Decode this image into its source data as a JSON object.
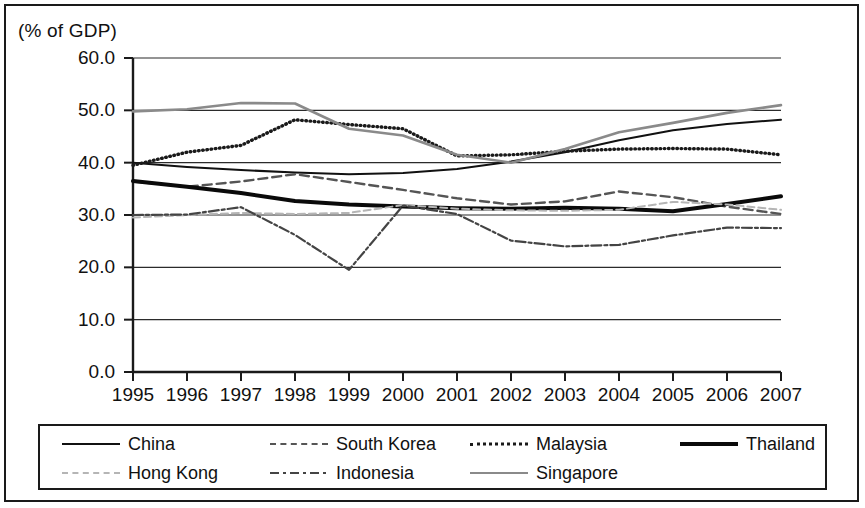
{
  "axis_title": "(% of GDP)",
  "legend": {
    "rows": [
      [
        {
          "label": "China",
          "style": "solid-thin",
          "color": "#111111"
        },
        {
          "label": "South Korea",
          "style": "dashed",
          "color": "#555555"
        },
        {
          "label": "Malaysia",
          "style": "dotted",
          "color": "#1a1a1a"
        },
        {
          "label": "Thailand",
          "style": "solid-thick",
          "color": "#0a0a0a"
        }
      ],
      [
        {
          "label": "Hong Kong",
          "style": "gray-thin",
          "color": "#b5b5b5"
        },
        {
          "label": "Indonesia",
          "style": "dashdot",
          "color": "#444444"
        },
        {
          "label": "Singapore",
          "style": "solid-gray",
          "color": "#8a8a8a"
        }
      ]
    ]
  },
  "chart_data": {
    "type": "line",
    "title": "",
    "xlabel": "",
    "ylabel": "(% of GDP)",
    "ylim": [
      0.0,
      60.0
    ],
    "yticks": [
      "0.0",
      "10.0",
      "20.0",
      "30.0",
      "40.0",
      "50.0",
      "60.0"
    ],
    "ytick_values": [
      0.0,
      10.0,
      20.0,
      30.0,
      40.0,
      50.0,
      60.0
    ],
    "grid": true,
    "legend_position": "bottom",
    "categories": [
      "1995",
      "1996",
      "1997",
      "1998",
      "1999",
      "2000",
      "2001",
      "2002",
      "2003",
      "2004",
      "2005",
      "2006",
      "2007"
    ],
    "series": [
      {
        "name": "China",
        "style": "solid-thin",
        "color": "#111111",
        "values": [
          40.0,
          39.2,
          38.6,
          38.1,
          37.8,
          38.0,
          38.8,
          40.2,
          42.0,
          44.3,
          46.2,
          47.4,
          48.2
        ]
      },
      {
        "name": "South Korea",
        "style": "dashed",
        "color": "#555555",
        "values": [
          36.4,
          35.4,
          36.4,
          37.8,
          36.3,
          34.8,
          33.2,
          32.0,
          32.6,
          34.5,
          33.4,
          31.6,
          30.2
        ]
      },
      {
        "name": "Malaysia",
        "style": "dotted",
        "color": "#1a1a1a",
        "values": [
          39.5,
          42.0,
          43.3,
          48.2,
          47.3,
          46.5,
          41.3,
          41.5,
          42.2,
          42.6,
          42.7,
          42.6,
          41.5
        ]
      },
      {
        "name": "Thailand",
        "style": "solid-thick",
        "color": "#0a0a0a",
        "values": [
          36.5,
          35.4,
          34.2,
          32.7,
          32.0,
          31.6,
          31.3,
          31.2,
          31.4,
          31.2,
          30.7,
          32.1,
          33.6
        ]
      },
      {
        "name": "Hong Kong",
        "style": "gray-thin",
        "color": "#b5b5b5",
        "values": [
          29.5,
          30.0,
          30.4,
          30.2,
          30.4,
          31.9,
          31.2,
          30.9,
          30.8,
          31.0,
          32.5,
          32.0,
          31.0
        ]
      },
      {
        "name": "Indonesia",
        "style": "dashdot",
        "color": "#444444",
        "values": [
          30.0,
          30.1,
          31.5,
          26.2,
          19.5,
          31.8,
          30.2,
          25.1,
          24.0,
          24.3,
          26.1,
          27.6,
          27.5
        ]
      },
      {
        "name": "Singapore",
        "style": "solid-gray",
        "color": "#8a8a8a",
        "values": [
          49.8,
          50.2,
          51.4,
          51.3,
          46.5,
          45.2,
          41.5,
          40.0,
          42.6,
          45.8,
          47.6,
          49.5,
          51.0
        ]
      }
    ]
  }
}
